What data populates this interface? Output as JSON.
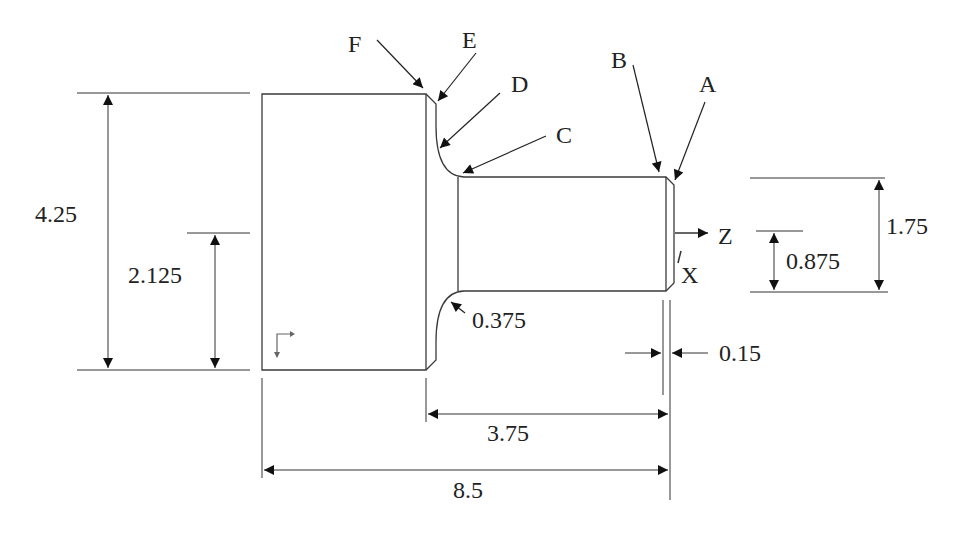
{
  "figure": {
    "type": "turned part technical drawing",
    "colors": {
      "line": "#3a3a3a",
      "arrow": "#111111",
      "text": "#222222",
      "background": "#ffffff"
    }
  },
  "point_labels": {
    "A": "A",
    "B": "B",
    "C": "C",
    "D": "D",
    "E": "E",
    "F": "F"
  },
  "axes": {
    "z": "Z",
    "x": "X"
  },
  "dimensions": {
    "overall_diameter": "4.25",
    "overall_radius": "2.125",
    "small_diameter": "1.75",
    "small_radius": "0.875",
    "fillet_radius": "0.375",
    "chamfer": "0.15",
    "shoulder_length": "3.75",
    "overall_length": "8.5"
  }
}
